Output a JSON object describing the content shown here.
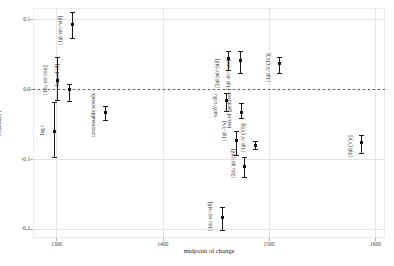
{
  "figure": {
    "x_axis_title": "midpoint of change",
    "y_axis_title": "Pearson's r"
  },
  "chart_data": {
    "type": "scatter",
    "title": "",
    "xlabel": "midpoint of change",
    "ylabel": "Pearson's r",
    "xlim": [
      1278,
      1609
    ],
    "ylim": [
      -0.213,
      0.116
    ],
    "grid": true,
    "legend": "none",
    "zero_line": {
      "y": 0.0,
      "style": "dashed"
    },
    "x_ticks": [
      {
        "v": 1300,
        "label": "1300"
      },
      {
        "v": 1400,
        "label": "1400"
      },
      {
        "v": 1500,
        "label": "1500"
      },
      {
        "v": 1600,
        "label": "1600"
      }
    ],
    "y_ticks": [
      {
        "v": 0.1,
        "label": "0.1"
      },
      {
        "v": 0.0,
        "label": "0.0"
      },
      {
        "v": -0.1,
        "label": "-0.1"
      },
      {
        "v": -0.2,
        "label": "-0.2"
      }
    ],
    "points": [
      {
        "label": "[1pl vér>við]",
        "x": 1315,
        "y": 0.093,
        "ci": [
          0.073,
          0.11
        ],
        "label_end": 0.063
      },
      {
        "label": "[1du vit>mit]",
        "x": 1301,
        "y": 0.013,
        "ci": [
          -0.016,
          0.046
        ],
        "label_end": -0.009
      },
      {
        "label": "loss of [ð]",
        "x": 1312,
        "y": -0.001,
        "ci": [
          -0.017,
          0.007
        ],
        "label_end": 0.004
      },
      {
        "label": "1sg r",
        "x": 1298,
        "y": -0.06,
        "ci": [
          -0.097,
          -0.019
        ],
        "label_end": -0.067
      },
      {
        "label": "unstressable vowels",
        "x": 1346,
        "y": -0.033,
        "ci": [
          -0.044,
          -0.024
        ],
        "label_end": -0.069
      },
      {
        "label": "[2pl þér>þið]",
        "x": 1462,
        "y": 0.044,
        "ci": [
          0.027,
          0.054
        ],
        "label_end": 0.001
      },
      {
        "label": "[1pl -ér>-um]",
        "x": 1473,
        "y": 0.041,
        "ci": [
          0.023,
          0.054
        ],
        "label_end": -0.001
      },
      {
        "label": "[1pl -V (IV)]",
        "x": 1510,
        "y": 0.037,
        "ci": [
          0.023,
          0.046
        ],
        "label_end": 0.01
      },
      {
        "label": "varð>urðu",
        "x": 1460,
        "y": -0.016,
        "ci": [
          -0.031,
          -0.006
        ],
        "label_end": -0.04
      },
      {
        "label": "loss of genitives",
        "x": 1474,
        "y": -0.034,
        "ci": [
          -0.041,
          -0.02
        ],
        "label_end": -0.056
      },
      {
        "label": "[1pl -Vs]",
        "x": 1469,
        "y": -0.073,
        "ci": [
          -0.094,
          -0.06
        ],
        "label_end": -0.074
      },
      {
        "label": "[1pl -V (VI)]",
        "x": 1487,
        "y": -0.08,
        "ci": [
          -0.086,
          -0.074
        ],
        "label_end": -0.09
      },
      {
        "label": "[2du þit>þið]",
        "x": 1477,
        "y": -0.111,
        "ci": [
          -0.126,
          -0.097
        ],
        "label_end": -0.127
      },
      {
        "label": "[1du vit>við]",
        "x": 1456,
        "y": -0.184,
        "ci": [
          -0.201,
          -0.169
        ],
        "label_end": -0.203
      },
      {
        "label": "[3pl (V)r]",
        "x": 1587,
        "y": -0.077,
        "ci": [
          -0.091,
          -0.066
        ],
        "label_end": -0.097
      }
    ]
  }
}
